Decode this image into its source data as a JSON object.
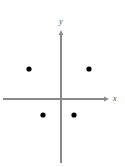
{
  "figure": {
    "title": "",
    "background_color": "#ffffff",
    "width": 125,
    "height": 167
  },
  "axes": {
    "x": {
      "label": "x",
      "color": "#8a8a8a",
      "start_px": 3,
      "end_px": 109,
      "y_px": 99,
      "arrow": "right"
    },
    "y": {
      "label": "y",
      "color": "#8a8a8a",
      "start_px": 30,
      "end_px": 163,
      "x_px": 61,
      "arrow": "up"
    },
    "origin_px": [
      61,
      99
    ]
  },
  "chart_data": {
    "type": "scatter",
    "title": "",
    "xlabel": "x",
    "ylabel": "y",
    "grid": false,
    "legend": null,
    "point_color": "#000000",
    "point_radius_px": 2.6,
    "xlim": [
      -58,
      64
    ],
    "ylim": [
      -64,
      69
    ],
    "points": [
      {
        "label": "upper-left",
        "x": -32,
        "y": 30,
        "px": [
          29,
          69
        ]
      },
      {
        "label": "upper-right",
        "x": 28,
        "y": 30,
        "px": [
          89,
          69
        ]
      },
      {
        "label": "lower-left",
        "x": -18,
        "y": -16,
        "px": [
          43,
          115
        ]
      },
      {
        "label": "lower-right",
        "x": 13,
        "y": -16,
        "px": [
          74,
          115
        ]
      }
    ]
  }
}
